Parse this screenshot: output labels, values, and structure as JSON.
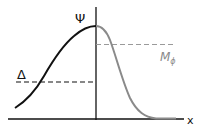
{
  "diagram": {
    "labels": {
      "psi": "Ψ",
      "delta": "Δ",
      "m_phi_main": "M",
      "m_phi_sub": "ϕ",
      "x_axis": "x"
    },
    "colors": {
      "black_curve": "#111111",
      "gray_curve": "#8a8a8a",
      "axis": "#111111",
      "gray_dashed": "#9a9a9a",
      "black_dashed": "#111111",
      "m_phi_label": "#8a8a8a"
    }
  }
}
